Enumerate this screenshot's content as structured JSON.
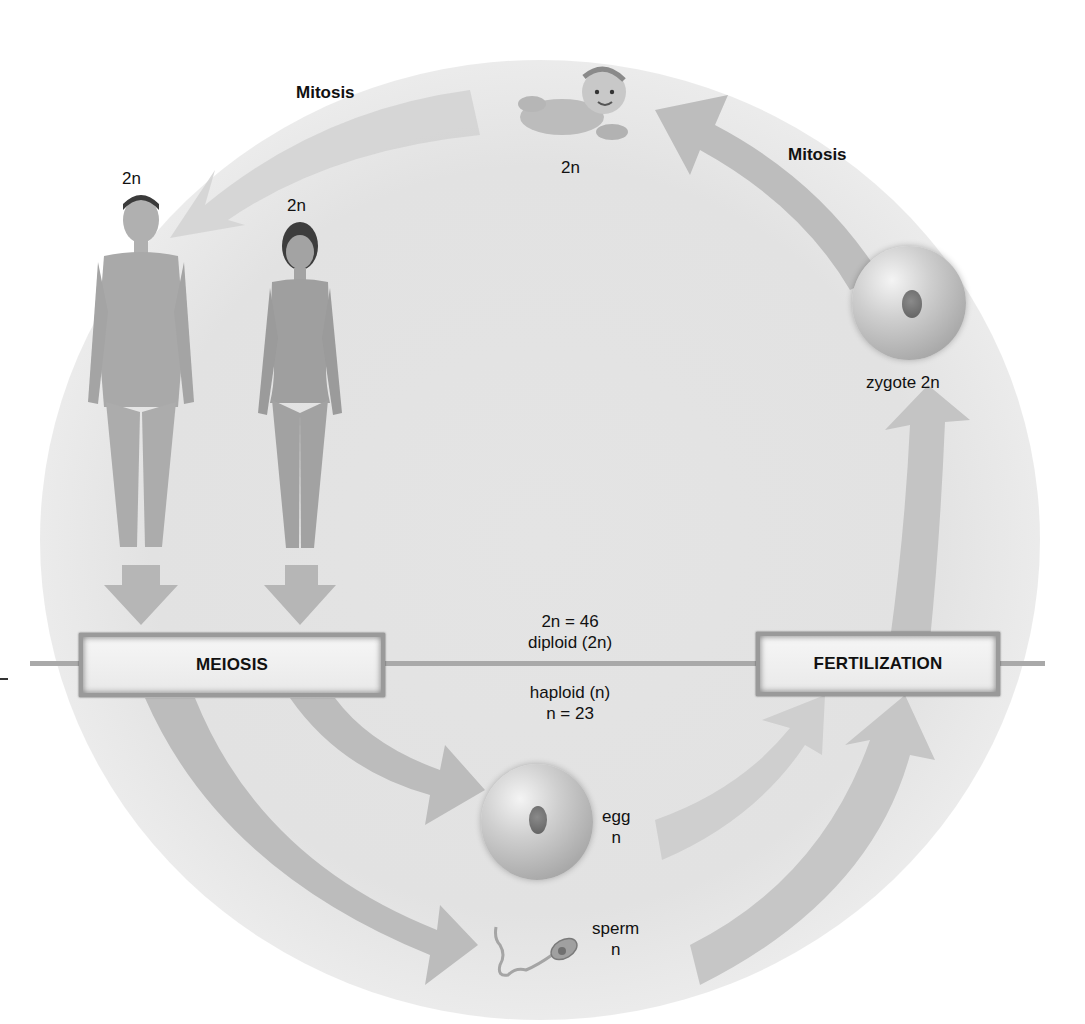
{
  "diagram": {
    "processes": {
      "meiosis": "MEIOSIS",
      "fertilization": "FERTILIZATION",
      "mitosis_top_left": "Mitosis",
      "mitosis_top_right": "Mitosis"
    },
    "ploidy_divider": {
      "above_count": "2n = 46",
      "above_label": "diploid (2n)",
      "below_label": "haploid (n)",
      "below_count": "n = 23"
    },
    "stages": {
      "male": {
        "label": "2n"
      },
      "female": {
        "label": "2n"
      },
      "baby": {
        "label": "2n"
      },
      "zygote": {
        "label": "zygote 2n"
      },
      "egg": {
        "name": "egg",
        "ploidy": "n"
      },
      "sperm": {
        "name": "sperm",
        "ploidy": "n"
      }
    },
    "colors": {
      "arrow": "#b8b8b8",
      "box_border": "#9a9a9a",
      "divider_line": "#a9a9a9",
      "background": "#e3e3e3"
    }
  }
}
